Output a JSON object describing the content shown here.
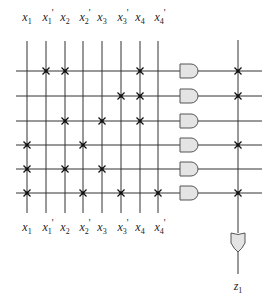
{
  "diagram": {
    "colors": {
      "line": "#333333",
      "gate_fill": "#e4e4e4",
      "gate_stroke": "#555555",
      "mark": "#111111"
    },
    "inputs": [
      {
        "name": "x",
        "sub": "1",
        "prime": ""
      },
      {
        "name": "x",
        "sub": "1",
        "prime": "'"
      },
      {
        "name": "x",
        "sub": "2",
        "prime": ""
      },
      {
        "name": "x",
        "sub": "2",
        "prime": "'"
      },
      {
        "name": "x",
        "sub": "3",
        "prime": ""
      },
      {
        "name": "x",
        "sub": "3",
        "prime": "'"
      },
      {
        "name": "x",
        "sub": "4",
        "prime": ""
      },
      {
        "name": "x",
        "sub": "4",
        "prime": "'"
      }
    ],
    "and_plane": [
      {
        "row": 1,
        "connections": [
          1,
          2,
          6
        ]
      },
      {
        "row": 2,
        "connections": [
          5,
          6
        ]
      },
      {
        "row": 3,
        "connections": [
          2,
          4,
          6
        ]
      },
      {
        "row": 4,
        "connections": [
          0,
          3
        ]
      },
      {
        "row": 5,
        "connections": [
          0,
          2,
          4
        ]
      },
      {
        "row": 6,
        "connections": [
          0,
          3,
          5,
          7
        ]
      }
    ],
    "or_plane": {
      "connected_rows": [
        0,
        1,
        3,
        5
      ]
    },
    "output": {
      "name": "z",
      "sub": "1"
    }
  }
}
